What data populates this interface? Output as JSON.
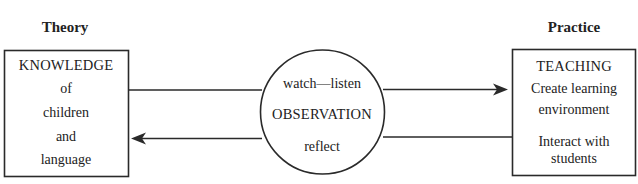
{
  "headings": {
    "theory": "Theory",
    "practice": "Practice"
  },
  "theory_box": {
    "lines": [
      "KNOWLEDGE",
      "of",
      "children",
      "and",
      "language"
    ]
  },
  "observation_circle": {
    "top": "watch—listen",
    "center": "OBSERVATION",
    "bottom": "reflect"
  },
  "practice_box": {
    "lines": [
      "TEACHING",
      "Create learning",
      "environment",
      "Interact with",
      "students"
    ]
  },
  "arrows": [
    {
      "from": "theory_box",
      "to": "practice_box",
      "via": "observation_circle",
      "direction": "right"
    },
    {
      "from": "practice_box",
      "to": "theory_box",
      "via": "observation_circle",
      "direction": "left"
    }
  ],
  "colors": {
    "stroke": "#2a2a2a",
    "text": "#222222",
    "background": "#ffffff"
  }
}
